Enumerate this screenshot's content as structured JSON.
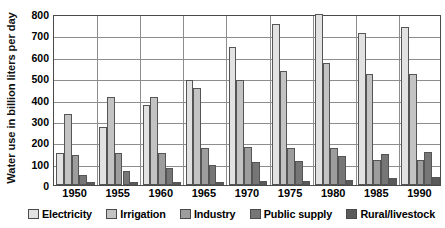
{
  "chart_data": {
    "type": "bar",
    "title": "",
    "subtitle": "",
    "xlabel": "",
    "ylabel": "Water use in billion liters per day",
    "ylim": [
      0,
      800
    ],
    "ytick_step": 100,
    "yticks": [
      "800",
      "700",
      "600",
      "500",
      "400",
      "300",
      "200",
      "100",
      "0"
    ],
    "grid": true,
    "legend_position": "bottom",
    "categories": [
      "1950",
      "1955",
      "1960",
      "1965",
      "1970",
      "1975",
      "1980",
      "1985",
      "1990"
    ],
    "series": [
      {
        "name": "Electricity",
        "color": "#e2e2e2",
        "values": [
          150,
          270,
          375,
          492,
          645,
          755,
          800,
          712,
          740
        ]
      },
      {
        "name": "Irrigation",
        "color": "#c3c3c3",
        "values": [
          330,
          412,
          413,
          455,
          492,
          533,
          572,
          520,
          520
        ]
      },
      {
        "name": "Industry",
        "color": "#9d9d9d",
        "values": [
          140,
          150,
          148,
          173,
          178,
          173,
          174,
          118,
          118
        ]
      },
      {
        "name": "Public supply",
        "color": "#767676",
        "values": [
          48,
          65,
          80,
          95,
          109,
          112,
          134,
          145,
          155
        ]
      },
      {
        "name": "Rural/livestock",
        "color": "#5a5a5a",
        "values": [
          12,
          13,
          14,
          16,
          17,
          20,
          25,
          34,
          36
        ]
      }
    ]
  },
  "legend": {
    "items": [
      {
        "label": "Electricity",
        "swatch": "#e2e2e2"
      },
      {
        "label": "Irrigation",
        "swatch": "#c3c3c3"
      },
      {
        "label": "Industry",
        "swatch": "#9d9d9d"
      },
      {
        "label": "Public supply",
        "swatch": "#767676"
      },
      {
        "label": "Rural/livestock",
        "swatch": "#5a5a5a"
      }
    ]
  }
}
